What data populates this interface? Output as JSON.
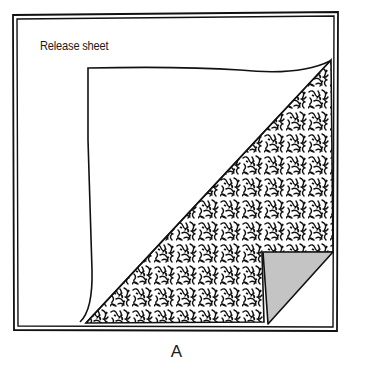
{
  "figure": {
    "labels": {
      "release_sheet": "Release sheet"
    },
    "caption": "A",
    "colors": {
      "line": "#111111",
      "peel_fill": "#c4c4c4",
      "background": "#ffffff"
    }
  }
}
